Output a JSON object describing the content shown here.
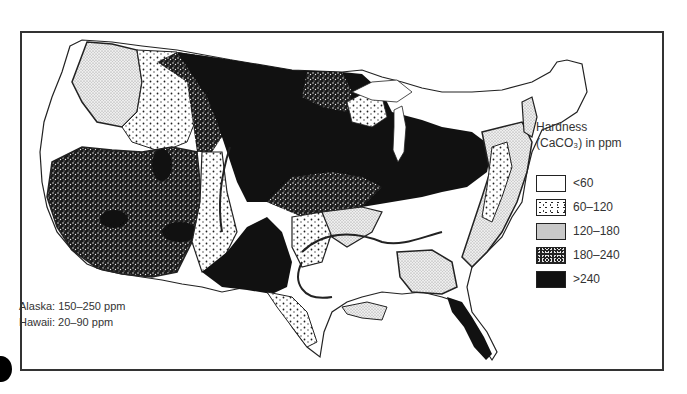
{
  "legend": {
    "title_line1": "Hardness",
    "title_line2": "(CaCO₃) in ppm",
    "items": [
      {
        "label": "<60",
        "pattern": "white"
      },
      {
        "label": "60–120",
        "pattern": "sparse-dots"
      },
      {
        "label": "120–180",
        "pattern": "fine-stipple"
      },
      {
        "label": "180–240",
        "pattern": "dense-speckle"
      },
      {
        "label": ">240",
        "pattern": "solid-black"
      }
    ]
  },
  "notes": {
    "alaska": "Alaska: 150–250 ppm",
    "hawaii": "Hawaii: 20–90 ppm"
  },
  "map": {
    "subject": "Water hardness across the contiguous United States",
    "colors": {
      "frame": "#333333",
      "solid": "#111111",
      "background": "#ffffff"
    }
  }
}
